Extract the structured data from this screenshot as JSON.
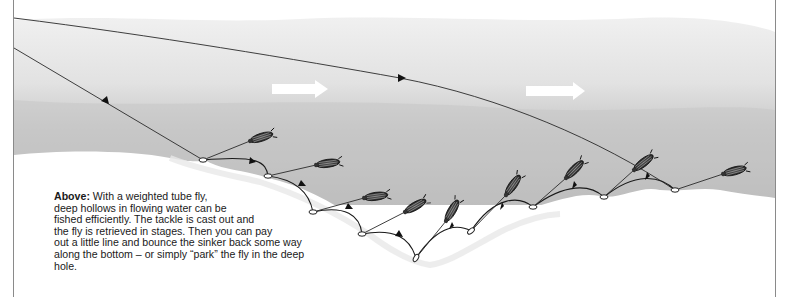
{
  "caption": {
    "lead": "Above:",
    "lines": [
      " With a weighted tube fly,",
      "deep hollows in flowing water can be",
      "fished efficiently. The tackle is cast out and",
      "the fly is retrieved in stages. Then you can pay",
      "out a little line and bounce the sinker back some way",
      "along the bottom – or simply “park” the fly in the deep",
      "hole."
    ]
  },
  "illustration": {
    "subject": "weighted tube fly retrieved in stages through deep hollow in flowing water",
    "current_arrows": 2,
    "fly_positions": 9,
    "colors": {
      "water_light": "#e4e4e4",
      "water_dark": "#b9b9b9",
      "line": "#2a2a2a",
      "riverbed": "#ffffff",
      "border": "#8a8a8a"
    }
  }
}
